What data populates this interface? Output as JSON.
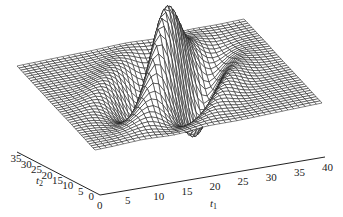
{
  "chart_data": {
    "type": "surface3d",
    "title": "",
    "x_axis": {
      "label": "t1",
      "label_main": "t",
      "label_sub": "1",
      "range": [
        0,
        40
      ],
      "ticks": [
        0,
        5,
        10,
        15,
        20,
        25,
        30,
        35,
        40
      ]
    },
    "y_axis": {
      "label": "t2",
      "label_main": "t",
      "label_sub": "2",
      "range": [
        0,
        40
      ],
      "ticks": [
        0,
        5,
        10,
        15,
        20,
        25,
        30,
        35
      ]
    },
    "z_axis": {
      "label": "",
      "ticks": []
    },
    "surface": {
      "grid_resolution": 41,
      "center": {
        "t1": 20,
        "t2": 20
      },
      "features": [
        {
          "type": "peak",
          "approx_t1": 20,
          "approx_t2": 22,
          "note": "main (tallest) peak"
        },
        {
          "type": "peak",
          "approx_t1": 15,
          "approx_t2": 18,
          "note": "secondary peak"
        },
        {
          "type": "trough",
          "approx_t1": 25,
          "approx_t2": 15,
          "note": "front depression"
        },
        {
          "type": "trough",
          "approx_t1": 12,
          "approx_t2": 28,
          "note": "back depression"
        }
      ]
    },
    "grid": false,
    "legend": null,
    "colors": {
      "mesh_stroke": "#1a1a1a",
      "mesh_fill": "#ffffff",
      "background": "#ffffff"
    }
  }
}
